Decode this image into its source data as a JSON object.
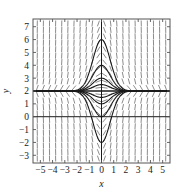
{
  "chart_data": {
    "type": "line",
    "title": "",
    "subtitle": "",
    "xlabel": "x",
    "ylabel": "y",
    "xlim": [
      -5.6,
      5.6
    ],
    "ylim": [
      -3.6,
      7.6
    ],
    "xticks": [
      -5,
      -4,
      -3,
      -2,
      -1,
      0,
      1,
      2,
      3,
      4,
      5
    ],
    "xticklabels": [
      "−5",
      "−4",
      "−3",
      "−2",
      "−1",
      "0",
      "1",
      "2",
      "3",
      "4",
      "5"
    ],
    "yticks": [
      -3,
      -2,
      -1,
      0,
      1,
      2,
      3,
      4,
      5,
      6,
      7
    ],
    "yticklabels": [
      "−3",
      "−2",
      "−1",
      "0",
      "1",
      "2",
      "3",
      "4",
      "5",
      "6",
      "7"
    ],
    "grid": false,
    "legend": null,
    "frame": true,
    "overlay": "slope-field",
    "slope_field": {
      "description": "direction field of dy/dx = -2x(y-2)",
      "equation_slope": "-2*x*(y-2)",
      "x_samples": [
        -5.25,
        -4.75,
        -4.25,
        -3.75,
        -3.25,
        -2.75,
        -2.25,
        -1.75,
        -1.25,
        -0.75,
        -0.25,
        0.25,
        0.75,
        1.25,
        1.75,
        2.25,
        2.75,
        3.25,
        3.75,
        4.25,
        4.75,
        5.25
      ],
      "y_samples": [
        -3.25,
        -2.75,
        -2.25,
        -1.75,
        -1.25,
        -0.75,
        -0.25,
        0.25,
        0.75,
        1.25,
        1.75,
        2.25,
        2.75,
        3.25,
        3.75,
        4.25,
        4.75,
        5.25,
        5.75,
        6.25,
        6.75,
        7.25
      ],
      "tick_color": "#6e6e6e",
      "tick_length_px": 6
    },
    "equilibrium": {
      "y": 2,
      "label": "y = 2",
      "color": "#1a1a1a"
    },
    "series": [
      {
        "name": "solution y = 2 + 4e^(-x^2)",
        "form": "2 + A*exp(-x*x)",
        "A": 4.0,
        "peak": {
          "x": 0,
          "y": 6
        },
        "color": "#1a1a1a"
      },
      {
        "name": "solution y = 2 + 2e^(-x^2)",
        "form": "2 + A*exp(-x*x)",
        "A": 2.0,
        "peak": {
          "x": 0,
          "y": 4
        },
        "color": "#1a1a1a"
      },
      {
        "name": "solution y = 2 + 1e^(-x^2)",
        "form": "2 + A*exp(-x*x)",
        "A": 1.0,
        "peak": {
          "x": 0,
          "y": 3
        },
        "color": "#1a1a1a"
      },
      {
        "name": "solution y = 2 + 0.5e^(-x^2)",
        "form": "2 + A*exp(-x*x)",
        "A": 0.5,
        "peak": {
          "x": 0,
          "y": 2.5
        },
        "color": "#1a1a1a"
      },
      {
        "name": "solution y = 2 - 0.5e^(-x^2)",
        "form": "2 + A*exp(-x*x)",
        "A": -0.5,
        "peak": {
          "x": 0,
          "y": 1.5
        },
        "color": "#1a1a1a"
      },
      {
        "name": "solution y = 2 - 1e^(-x^2)",
        "form": "2 + A*exp(-x*x)",
        "A": -1.0,
        "peak": {
          "x": 0,
          "y": 1
        },
        "color": "#1a1a1a"
      },
      {
        "name": "solution y = 2 - 2e^(-x^2)",
        "form": "2 + A*exp(-x*x)",
        "A": -2.0,
        "peak": {
          "x": 0,
          "y": 0
        },
        "color": "#1a1a1a"
      },
      {
        "name": "solution y = 2 - 4e^(-x^2)",
        "form": "2 + A*exp(-x*x)",
        "A": -4.0,
        "peak": {
          "x": 0,
          "y": -2
        },
        "color": "#1a1a1a"
      }
    ],
    "colors": {
      "curve": "#1a1a1a",
      "axis": "#1a1a1a",
      "frame": "#555555",
      "field": "#6e6e6e",
      "background": "#ffffff"
    }
  }
}
